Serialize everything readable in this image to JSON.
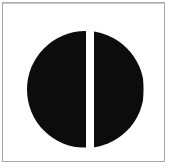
{
  "image": {
    "kind": "scanned-geometric-symbol",
    "width": 171,
    "height": 167,
    "background_color": "#ffffff",
    "caption": ""
  },
  "frame": {
    "name": "border-rectangle",
    "stroke_color": "#a8a8a8",
    "stroke_width_px": 1,
    "left": 2,
    "top": 2,
    "width": 163,
    "height": 160
  },
  "shape": {
    "name": "bisected-disc",
    "description": "Solid black circle split by a vertical white slit into a left half-disc and a right half-disc",
    "fill_color": "#0d0c0c",
    "slit_color": "#ffffff",
    "center_x": 85,
    "center_y": 89,
    "diameter": 117,
    "left_half_label": "left-half-disc",
    "right_half_label": "right-half-disc",
    "slit_x": 86,
    "slit_width": 8,
    "slit_top": 24,
    "slit_height": 124
  }
}
